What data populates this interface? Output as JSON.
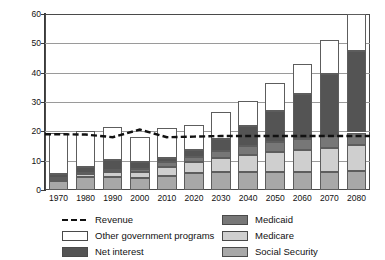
{
  "chart_data": {
    "type": "bar",
    "stacked": true,
    "title": "",
    "subtitle": "",
    "xlabel": "",
    "ylabel": "",
    "ylim": [
      0,
      60
    ],
    "yticks": [
      0,
      10,
      20,
      30,
      40,
      50,
      60
    ],
    "grid": true,
    "legend_position": "bottom",
    "categories": [
      "1970",
      "1980",
      "1990",
      "2000",
      "2010",
      "2020",
      "2030",
      "2040",
      "2050",
      "2060",
      "2070",
      "2080"
    ],
    "series": [
      {
        "name": "Social Security",
        "color": "#a8a8a8",
        "values": [
          3.0,
          4.3,
          4.3,
          4.1,
          4.8,
          5.8,
          6.1,
          6.2,
          6.2,
          6.2,
          6.3,
          6.4
        ]
      },
      {
        "name": "Medicare",
        "color": "#cfcfcf",
        "values": [
          0.7,
          1.1,
          1.8,
          2.0,
          3.0,
          3.6,
          4.8,
          5.8,
          6.7,
          7.4,
          8.1,
          8.8
        ]
      },
      {
        "name": "Medicaid",
        "color": "#777777",
        "values": [
          0.3,
          0.5,
          0.8,
          1.2,
          1.7,
          2.0,
          2.5,
          3.0,
          3.4,
          3.8,
          4.1,
          4.4
        ]
      },
      {
        "name": "Net interest",
        "color": "#545454",
        "values": [
          1.4,
          1.9,
          3.2,
          2.3,
          1.4,
          2.2,
          4.0,
          6.8,
          10.7,
          15.2,
          21.0,
          27.9
        ]
      },
      {
        "name": "Other government programs",
        "color": "#ffffff",
        "values": [
          14.1,
          12.2,
          11.4,
          8.4,
          10.1,
          8.4,
          9.1,
          8.7,
          9.5,
          10.4,
          11.5,
          12.5
        ]
      }
    ],
    "totals": [
      19.5,
      20.0,
      21.5,
      18.0,
      21.0,
      22.0,
      26.5,
      30.5,
      36.5,
      43.0,
      51.0,
      60.0
    ],
    "revenue_line": {
      "name": "Revenue",
      "style": "dashed",
      "color": "#111111",
      "x": [
        "1970",
        "1980",
        "1990",
        "2000",
        "2010",
        "2020",
        "2030",
        "2040",
        "2050",
        "2060",
        "2070",
        "2080"
      ],
      "values": [
        19.0,
        18.9,
        18.0,
        20.6,
        18.0,
        18.2,
        18.4,
        18.4,
        18.4,
        18.4,
        18.4,
        18.4
      ]
    }
  },
  "legend": {
    "items": [
      {
        "key": "revenue",
        "label": "Revenue"
      },
      {
        "key": "ogp",
        "label": "Other government programs"
      },
      {
        "key": "ni",
        "label": "Net interest"
      },
      {
        "key": "mcaid",
        "label": "Medicaid"
      },
      {
        "key": "mcare",
        "label": "Medicare"
      },
      {
        "key": "ss",
        "label": "Social Security"
      }
    ]
  },
  "top_note": ""
}
